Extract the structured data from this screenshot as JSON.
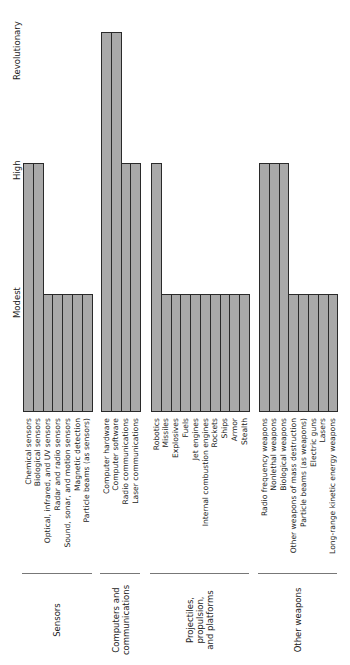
{
  "chart_data": {
    "type": "bar",
    "orientation": "rotated-90",
    "title": "",
    "xlabel": "",
    "ylabel": "",
    "levels": [
      "Modest",
      "High",
      "Revolutionary"
    ],
    "level_values": {
      "Modest": 1,
      "High": 2,
      "Revolutionary": 3
    },
    "ylim": [
      0,
      3
    ],
    "grid": false,
    "legend": null,
    "groups": [
      {
        "name": "Sensors",
        "items": [
          {
            "label": "Chemical sensors",
            "level": "High",
            "value": 2
          },
          {
            "label": "Biological sensors",
            "level": "High",
            "value": 2
          },
          {
            "label": "Optical, infrared, and UV sensors",
            "level": "Modest",
            "value": 1
          },
          {
            "label": "Radar and radio sensors",
            "level": "Modest",
            "value": 1
          },
          {
            "label": "Sound, sonar, and motion sensors",
            "level": "Modest",
            "value": 1
          },
          {
            "label": "Magnetic detection",
            "level": "Modest",
            "value": 1
          },
          {
            "label": "Particle beams (as sensors)",
            "level": "Modest",
            "value": 1
          }
        ]
      },
      {
        "name": "Computers and\ncommunications",
        "items": [
          {
            "label": "Computer hardware",
            "level": "Revolutionary",
            "value": 3
          },
          {
            "label": "Computer software",
            "level": "Revolutionary",
            "value": 3
          },
          {
            "label": "Radio communications",
            "level": "High",
            "value": 2
          },
          {
            "label": "Laser communications",
            "level": "High",
            "value": 2
          }
        ]
      },
      {
        "name": "Projectiles,\npropulsion,\nand platforms",
        "items": [
          {
            "label": "Robotics",
            "level": "High",
            "value": 2
          },
          {
            "label": "Missiles",
            "level": "Modest",
            "value": 1
          },
          {
            "label": "Explosives",
            "level": "Modest",
            "value": 1
          },
          {
            "label": "Fuels",
            "level": "Modest",
            "value": 1
          },
          {
            "label": "Jet engines",
            "level": "Modest",
            "value": 1
          },
          {
            "label": "Internal combustion engines",
            "level": "Modest",
            "value": 1
          },
          {
            "label": "Rockets",
            "level": "Modest",
            "value": 1
          },
          {
            "label": "Ships",
            "level": "Modest",
            "value": 1
          },
          {
            "label": "Armor",
            "level": "Modest",
            "value": 1
          },
          {
            "label": "Stealth",
            "level": "Modest",
            "value": 1
          }
        ]
      },
      {
        "name": "Other weapons",
        "items": [
          {
            "label": "Radio frequency weapons",
            "level": "High",
            "value": 2
          },
          {
            "label": "Nonlethal weapons",
            "level": "High",
            "value": 2
          },
          {
            "label": "Biological weapons",
            "level": "High",
            "value": 2
          },
          {
            "label": "Other weapons of mass destruction",
            "level": "Modest",
            "value": 1
          },
          {
            "label": "Particle beams (as weapons)",
            "level": "Modest",
            "value": 1
          },
          {
            "label": "Electric guns",
            "level": "Modest",
            "value": 1
          },
          {
            "label": "Lasers",
            "level": "Modest",
            "value": 1
          },
          {
            "label": "Long-range kinetic energy weapons",
            "level": "Modest",
            "value": 1
          }
        ]
      }
    ]
  },
  "layout": {
    "baseline_y": 412,
    "level_y": {
      "1": 294,
      "2": 163,
      "3": 32
    },
    "bar_width": 9.8,
    "group_x": [
      23,
      101,
      151,
      259
    ],
    "colors": {
      "bar_fill": "#a9a9a9",
      "bar_border": "#2a2a2a",
      "divider": "#777777"
    }
  }
}
